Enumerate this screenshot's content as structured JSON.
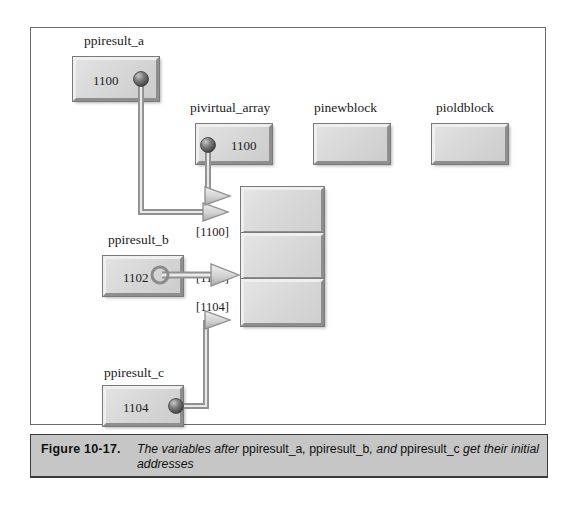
{
  "figure": {
    "caption_number": "Figure  10-17.",
    "caption_parts": {
      "p1": "The variables after ",
      "v1": "ppiresult_a",
      "p2": ", ",
      "v2": "ppiresult_b",
      "p3": ", and ",
      "v3": "ppiresult_c",
      "p4": " get their initial addresses"
    }
  },
  "variables": {
    "ppiresult_a": {
      "label": "ppiresult_a",
      "value": "1100"
    },
    "pivirtual_array": {
      "label": "pivirtual_array",
      "value": "1100"
    },
    "pinewblock": {
      "label": "pinewblock",
      "value": ""
    },
    "pioldblock": {
      "label": "pioldblock",
      "value": ""
    },
    "ppiresult_b": {
      "label": "ppiresult_b",
      "value": "1102"
    },
    "ppiresult_c": {
      "label": "ppiresult_c",
      "value": "1104"
    }
  },
  "array": {
    "index_labels": [
      "[1100]",
      "[1102]",
      "[1104]"
    ],
    "cells": [
      "",
      "",
      ""
    ]
  },
  "colors": {
    "box_fill": "#d9d9d9",
    "box_border_light": "#efefef",
    "box_border_dark": "#8e8e8e",
    "outline": "#7a7a7a",
    "caption_bg": "#c6c6c6",
    "frame_border": "#6b6b6b",
    "wire": "#8a8a8a",
    "page_bg": "#ffffff"
  }
}
